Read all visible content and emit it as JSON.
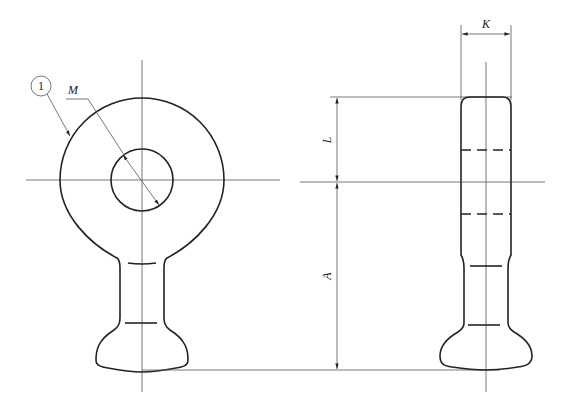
{
  "drawing": {
    "type": "technical-drawing",
    "subject": "eye bolt / ring terminal, front and side views",
    "callout": {
      "number": "1"
    },
    "dimensions": {
      "M": "M",
      "K": "K",
      "L": "L",
      "A": "A"
    }
  }
}
